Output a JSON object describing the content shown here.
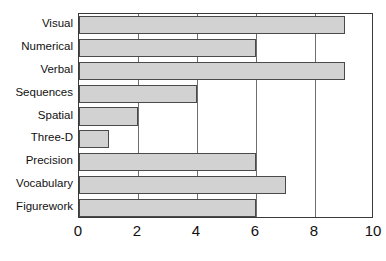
{
  "chart_data": {
    "type": "bar",
    "orientation": "horizontal",
    "title": "",
    "xlabel": "",
    "ylabel": "",
    "categories": [
      "Visual",
      "Numerical",
      "Verbal",
      "Sequences",
      "Spatial",
      "Three-D",
      "Precision",
      "Vocabulary",
      "Figurework"
    ],
    "values": [
      9,
      6,
      9,
      4,
      2,
      1,
      6,
      7,
      6
    ],
    "xlim": [
      0,
      10
    ],
    "xticks": [
      "0",
      "2",
      "4",
      "6",
      "8",
      "10"
    ],
    "xtick_values": [
      0,
      2,
      4,
      6,
      8,
      10
    ],
    "grid": true,
    "grid_axis": "x",
    "legend": null,
    "bar_color": "#d2d2d2",
    "bar_border_color": "#4a4a4a",
    "frame_color": "#3a3a3a"
  }
}
